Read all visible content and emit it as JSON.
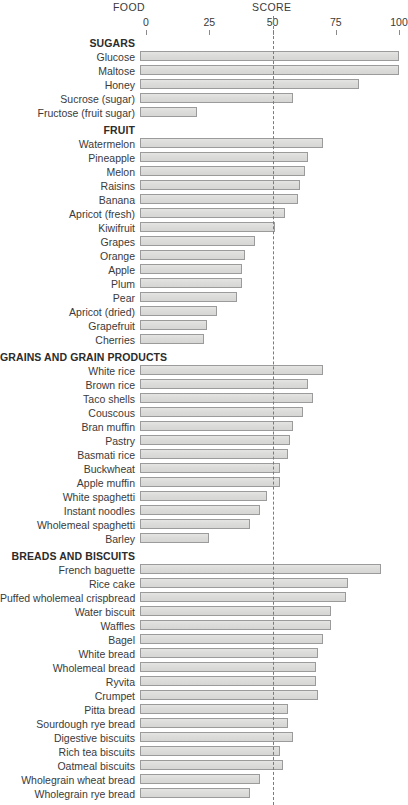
{
  "header": {
    "food_label": "FOOD",
    "score_label": "SCORE"
  },
  "axis": {
    "ticks": [
      "0",
      "25",
      "50",
      "75",
      "100"
    ],
    "tick_values": [
      0,
      25,
      50,
      75,
      100
    ],
    "reference_line_value": 50
  },
  "colors": {
    "bar_fill": "#dedede",
    "bar_border": "#9b9b9b",
    "text": "#3a3a3a",
    "reference_line": "#7b7b7b"
  },
  "chart_data": {
    "type": "bar",
    "orientation": "horizontal",
    "title": "",
    "xlabel": "SCORE",
    "ylabel": "FOOD",
    "xlim": [
      0,
      100
    ],
    "grid": false,
    "legend": "none",
    "reference_line": 50,
    "groups": [
      {
        "name": "SUGARS",
        "items": [
          {
            "label": "Glucose",
            "value": 100
          },
          {
            "label": "Maltose",
            "value": 100
          },
          {
            "label": "Honey",
            "value": 84
          },
          {
            "label": "Sucrose (sugar)",
            "value": 58
          },
          {
            "label": "Fructose (fruit sugar)",
            "value": 20
          }
        ]
      },
      {
        "name": "FRUIT",
        "items": [
          {
            "label": "Watermelon",
            "value": 70
          },
          {
            "label": "Pineapple",
            "value": 64
          },
          {
            "label": "Melon",
            "value": 63
          },
          {
            "label": "Raisins",
            "value": 61
          },
          {
            "label": "Banana",
            "value": 60
          },
          {
            "label": "Apricot (fresh)",
            "value": 55
          },
          {
            "label": "Kiwifruit",
            "value": 51
          },
          {
            "label": "Grapes",
            "value": 43
          },
          {
            "label": "Orange",
            "value": 39
          },
          {
            "label": "Apple",
            "value": 38
          },
          {
            "label": "Plum",
            "value": 38
          },
          {
            "label": "Pear",
            "value": 36
          },
          {
            "label": "Apricot (dried)",
            "value": 28
          },
          {
            "label": "Grapefruit",
            "value": 24
          },
          {
            "label": "Cherries",
            "value": 23
          }
        ]
      },
      {
        "name": "GRAINS AND GRAIN PRODUCTS",
        "items": [
          {
            "label": "White rice",
            "value": 70
          },
          {
            "label": "Brown rice",
            "value": 64
          },
          {
            "label": "Taco shells",
            "value": 66
          },
          {
            "label": "Couscous",
            "value": 62
          },
          {
            "label": "Bran muffin",
            "value": 58
          },
          {
            "label": "Pastry",
            "value": 57
          },
          {
            "label": "Basmati rice",
            "value": 56
          },
          {
            "label": "Buckwheat",
            "value": 53
          },
          {
            "label": "Apple muffin",
            "value": 53
          },
          {
            "label": "White spaghetti",
            "value": 48
          },
          {
            "label": "Instant noodles",
            "value": 45
          },
          {
            "label": "Wholemeal spaghetti",
            "value": 41
          },
          {
            "label": "Barley",
            "value": 25
          }
        ]
      },
      {
        "name": "BREADS AND BISCUITS",
        "items": [
          {
            "label": "French baguette",
            "value": 93
          },
          {
            "label": "Rice cake",
            "value": 80
          },
          {
            "label": "Puffed wholemeal crispbread",
            "value": 79
          },
          {
            "label": "Water biscuit",
            "value": 73
          },
          {
            "label": "Waffles",
            "value": 73
          },
          {
            "label": "Bagel",
            "value": 70
          },
          {
            "label": "White bread",
            "value": 68
          },
          {
            "label": "Wholemeal bread",
            "value": 67
          },
          {
            "label": "Ryvita",
            "value": 67
          },
          {
            "label": "Crumpet",
            "value": 68
          },
          {
            "label": "Pitta bread",
            "value": 56
          },
          {
            "label": "Sourdough rye bread",
            "value": 56
          },
          {
            "label": "Digestive biscuits",
            "value": 58
          },
          {
            "label": "Rich tea biscuits",
            "value": 53
          },
          {
            "label": "Oatmeal biscuits",
            "value": 54
          },
          {
            "label": "Wholegrain wheat bread",
            "value": 45
          },
          {
            "label": "Wholegrain rye bread",
            "value": 41
          }
        ]
      }
    ]
  }
}
